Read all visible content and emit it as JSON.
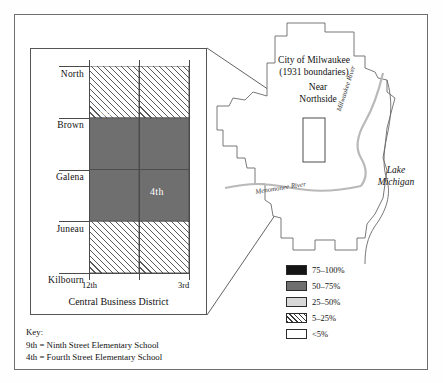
{
  "figure": {
    "inset": {
      "bottom_caption": "Central Business District",
      "street_rows": [
        {
          "label": "North"
        },
        {
          "label": "Brown"
        },
        {
          "label": "Galena"
        },
        {
          "label": "Juneau"
        },
        {
          "label": "Kilbourn"
        }
      ],
      "x_axis_labels": [
        {
          "label": "12th"
        },
        {
          "label": "3rd"
        }
      ],
      "cells": [
        {
          "row": 0,
          "col": 0,
          "fill": "hatch",
          "tag": ""
        },
        {
          "row": 0,
          "col": 1,
          "fill": "hatch",
          "tag": ""
        },
        {
          "row": 1,
          "col": 0,
          "fill": "dark",
          "tag": "9th"
        },
        {
          "row": 1,
          "col": 1,
          "fill": "dark",
          "tag": ""
        },
        {
          "row": 2,
          "col": 0,
          "fill": "dark",
          "tag": ""
        },
        {
          "row": 2,
          "col": 1,
          "fill": "dark",
          "tag": "4th"
        },
        {
          "row": 3,
          "col": 0,
          "fill": "hatch",
          "tag": ""
        },
        {
          "row": 3,
          "col": 1,
          "fill": "hatch",
          "tag": ""
        }
      ]
    },
    "citymap": {
      "title_line1": "City of Milwaukee",
      "title_line2": "(1931 boundaries)",
      "area_line1": "Near",
      "area_line2": "Northside",
      "river_menomonee": "Menomonee River",
      "river_milwaukee": "Milwaukee River",
      "lake_line1": "Lake",
      "lake_line2": "Michigan"
    },
    "legend": {
      "entries": [
        {
          "swatch": "black",
          "label": "75–100%"
        },
        {
          "swatch": "dark",
          "label": "50–75%"
        },
        {
          "swatch": "light",
          "label": "25–50%"
        },
        {
          "swatch": "hatch",
          "label": "5–25%"
        },
        {
          "swatch": "white",
          "label": "<5%"
        }
      ]
    },
    "key": {
      "heading": "Key:",
      "line1": "9th = Ninth Street Elementary School",
      "line2": "4th = Fourth Street Elementary School"
    },
    "colors": {
      "fill_dark": "#6f6f6f",
      "fill_black": "#141414",
      "fill_light": "#d8d8d8",
      "line": "#4a4a4a"
    }
  }
}
